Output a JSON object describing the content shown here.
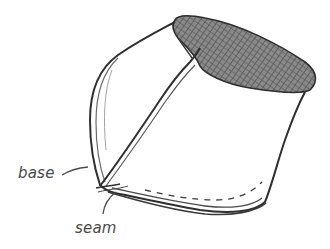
{
  "figure": {
    "labels": [
      {
        "id": "base",
        "text": "base"
      },
      {
        "id": "seam",
        "text": "seam"
      }
    ],
    "colors": {
      "stroke": "#3a3a3a",
      "hatch": "#6a6a6a",
      "label": "#4a4a4a",
      "background": "#ffffff"
    }
  }
}
